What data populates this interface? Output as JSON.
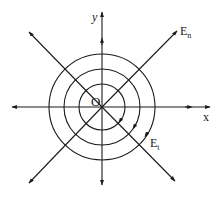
{
  "figure": {
    "type": "field-line-diagram",
    "origin_label": "O",
    "x_axis_label": "x",
    "y_axis_label": "y",
    "normal_field_label": "E",
    "normal_field_subscript": "n",
    "tangential_field_label": "E",
    "tangential_field_subscript": "t",
    "circle_count": 3,
    "radial_line_count": 8,
    "colors": {
      "stroke": "#1a1a1a",
      "background": "#ffffff"
    }
  }
}
